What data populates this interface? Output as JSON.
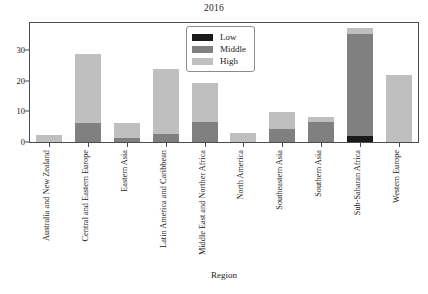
{
  "chart_data": {
    "type": "bar",
    "barmode": "stacked",
    "title": "2016",
    "xlabel": "Region",
    "ylabel": "",
    "ylim": [
      0,
      39
    ],
    "yticks": [
      0,
      10,
      20,
      30
    ],
    "grid": false,
    "legend_position": "top-center",
    "categories": [
      "Australia and New Zealand",
      "Central and Eastern Europe",
      "Eastern Asia",
      "Latin America and Caribbean",
      "Middle East and Norther Africa",
      "North America",
      "Southeastern Asia",
      "Southern Asia",
      "Sub-Saharan Africa",
      "Western Europe"
    ],
    "series": [
      {
        "name": "Low",
        "color": "#1a1a1a",
        "values": [
          0,
          0,
          0,
          0,
          0,
          0,
          0,
          0,
          1.9,
          0
        ]
      },
      {
        "name": "Middle",
        "color": "#808080",
        "values": [
          0,
          6.3,
          1.2,
          2.7,
          6.7,
          0,
          4.2,
          6.6,
          33.6,
          0
        ]
      },
      {
        "name": "High",
        "color": "#bfbfbf",
        "values": [
          2.3,
          22.7,
          5.1,
          21.3,
          12.8,
          3.0,
          5.8,
          1.6,
          2.0,
          22.0
        ]
      }
    ],
    "totals": [
      2.3,
      29.0,
      6.3,
      24.0,
      19.5,
      3.0,
      10.0,
      8.2,
      37.5,
      22.0
    ]
  },
  "legend": {
    "entries": [
      {
        "label": "Low",
        "color": "#1a1a1a"
      },
      {
        "label": "Middle",
        "color": "#808080"
      },
      {
        "label": "High",
        "color": "#bfbfbf"
      }
    ]
  },
  "axes": {
    "y_tick_labels": [
      "0",
      "10",
      "20",
      "30"
    ],
    "x_axis_title": "Region"
  },
  "colors": {
    "frame": "#4d4d4d",
    "background": "#ffffff",
    "text": "#1a1a1a"
  }
}
